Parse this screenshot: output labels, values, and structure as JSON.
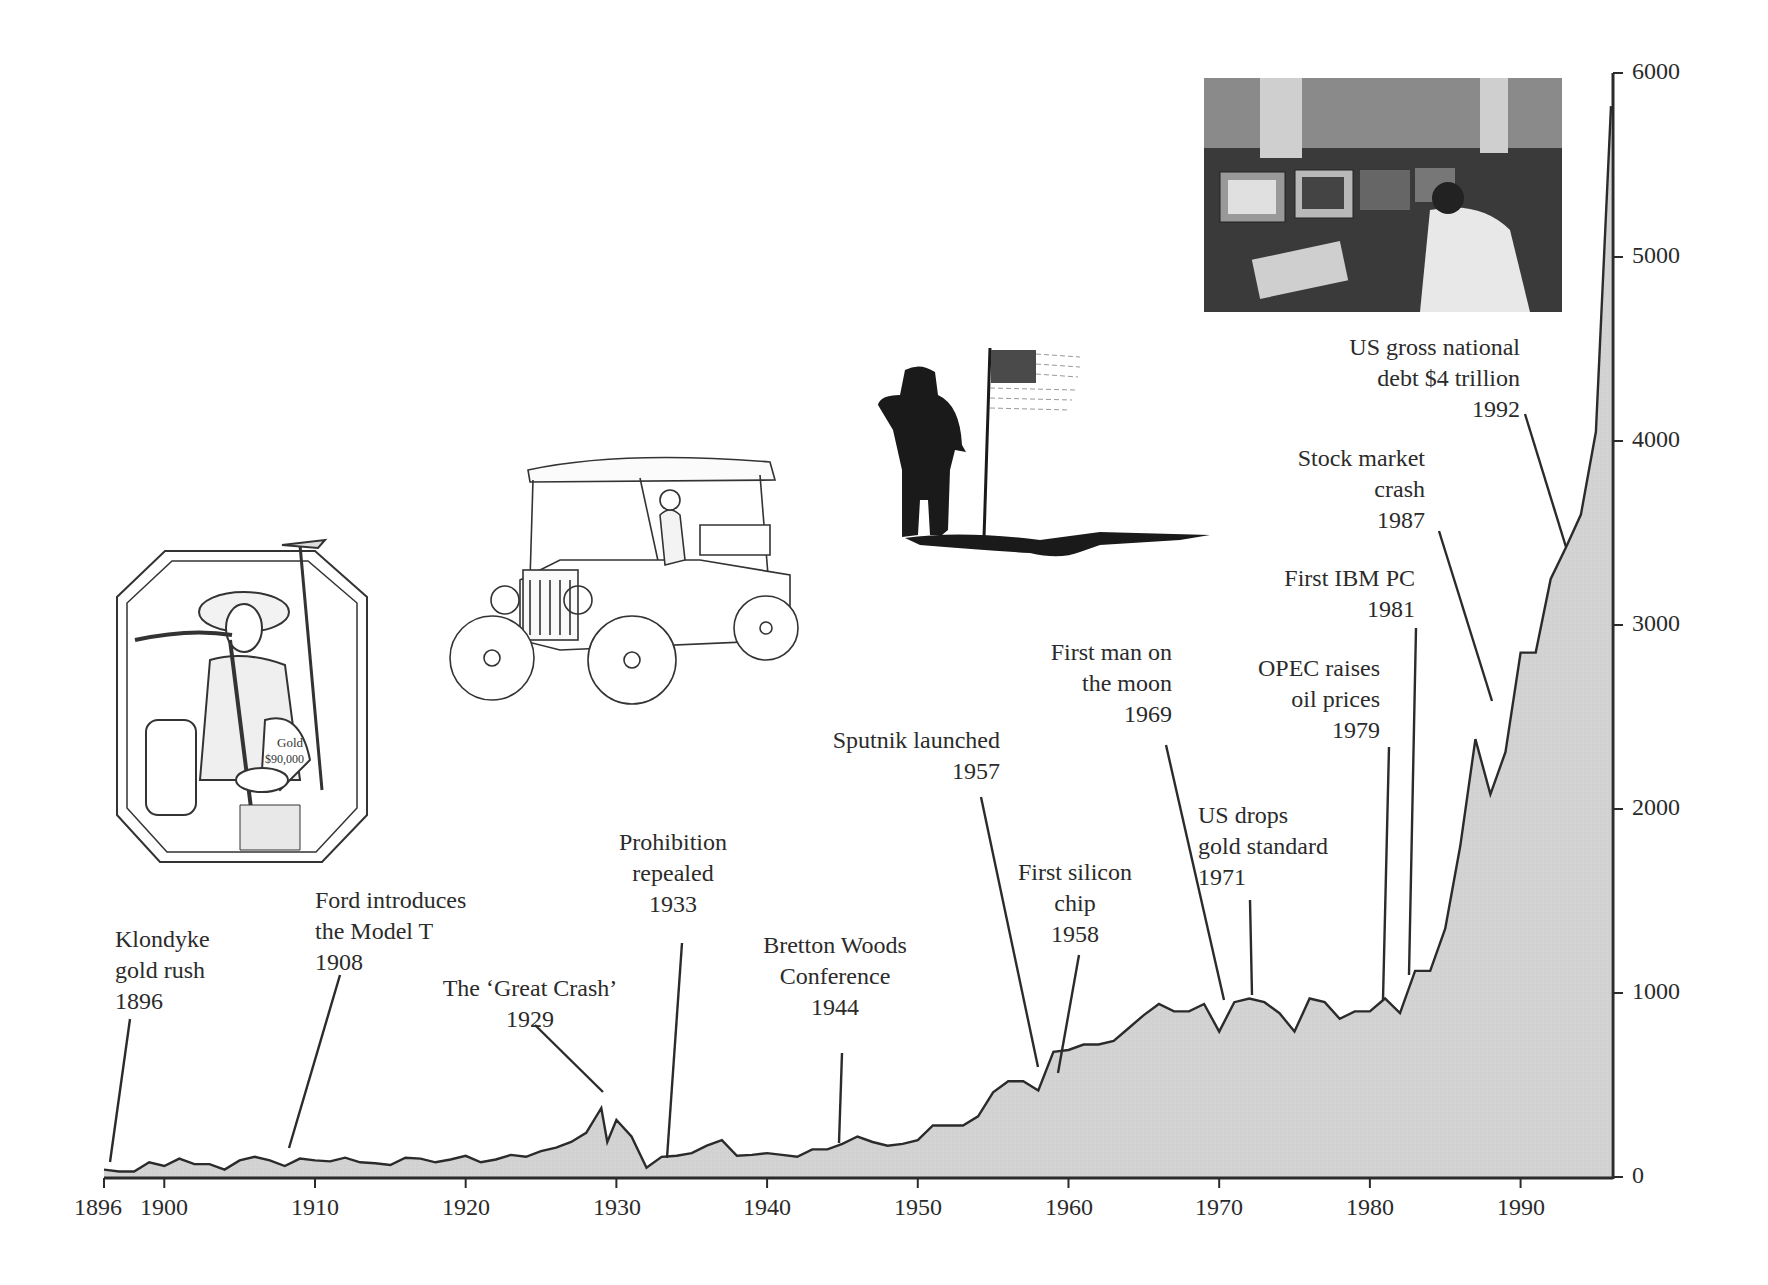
{
  "chart_data": {
    "type": "area",
    "title": "",
    "xlabel": "",
    "ylabel": "",
    "xlim": [
      1896,
      1996
    ],
    "ylim": [
      0,
      6000
    ],
    "grid": false,
    "legend": null,
    "x_ticks": [
      "1896",
      "1900",
      "1910",
      "1920",
      "1930",
      "1940",
      "1950",
      "1960",
      "1970",
      "1980",
      "1990"
    ],
    "y_ticks": [
      "0",
      "1000",
      "2000",
      "3000",
      "4000",
      "5000",
      "6000"
    ],
    "y_axis_position": "right",
    "x": [
      1896,
      1897,
      1898,
      1899,
      1900,
      1901,
      1902,
      1903,
      1904,
      1905,
      1906,
      1907,
      1908,
      1909,
      1910,
      1911,
      1912,
      1913,
      1914,
      1915,
      1916,
      1917,
      1918,
      1919,
      1920,
      1921,
      1922,
      1923,
      1924,
      1925,
      1926,
      1927,
      1928,
      1929,
      1929.4,
      1930,
      1931,
      1932,
      1933,
      1934,
      1935,
      1936,
      1937,
      1938,
      1939,
      1940,
      1941,
      1942,
      1943,
      1944,
      1945,
      1946,
      1947,
      1948,
      1949,
      1950,
      1951,
      1952,
      1953,
      1954,
      1955,
      1956,
      1957,
      1958,
      1959,
      1960,
      1961,
      1962,
      1963,
      1964,
      1965,
      1966,
      1967,
      1968,
      1969,
      1970,
      1971,
      1972,
      1973,
      1974,
      1975,
      1976,
      1977,
      1978,
      1979,
      1980,
      1981,
      1982,
      1983,
      1984,
      1985,
      1986,
      1987,
      1988,
      1989,
      1990,
      1991,
      1992,
      1993,
      1994,
      1995,
      1996
    ],
    "values": [
      40,
      30,
      30,
      80,
      60,
      100,
      70,
      70,
      40,
      90,
      110,
      90,
      60,
      100,
      90,
      85,
      105,
      80,
      75,
      65,
      105,
      100,
      80,
      95,
      115,
      80,
      95,
      120,
      110,
      140,
      160,
      190,
      240,
      375,
      190,
      310,
      220,
      50,
      110,
      115,
      130,
      170,
      200,
      115,
      120,
      130,
      120,
      110,
      150,
      150,
      180,
      220,
      190,
      170,
      180,
      200,
      280,
      280,
      280,
      330,
      460,
      520,
      520,
      470,
      680,
      690,
      720,
      720,
      740,
      810,
      880,
      940,
      900,
      900,
      940,
      790,
      950,
      970,
      950,
      890,
      790,
      970,
      950,
      860,
      900,
      900,
      970,
      890,
      1120,
      1120,
      1350,
      1800,
      2380,
      2080,
      2310,
      2850,
      2850,
      3250,
      3420,
      3600,
      4050,
      5820
    ],
    "annotations": [
      {
        "text": [
          "Klondyke",
          "gold rush",
          "1896"
        ],
        "year": 1896
      },
      {
        "text": [
          "Ford introduces",
          "the Model T",
          "1908"
        ],
        "year": 1908
      },
      {
        "text": [
          "The ‘Great Crash’",
          "1929"
        ],
        "year": 1929
      },
      {
        "text": [
          "Prohibition",
          "repealed",
          "1933"
        ],
        "year": 1933
      },
      {
        "text": [
          "Bretton Woods",
          "Conference",
          "1944"
        ],
        "year": 1944
      },
      {
        "text": [
          "Sputnik launched",
          "1957"
        ],
        "year": 1957
      },
      {
        "text": [
          "First silicon",
          "chip",
          "1958"
        ],
        "year": 1958
      },
      {
        "text": [
          "First man on",
          "the moon",
          "1969"
        ],
        "year": 1969
      },
      {
        "text": [
          "US drops",
          "gold standard",
          "1971"
        ],
        "year": 1971
      },
      {
        "text": [
          "OPEC raises",
          "oil prices",
          "1979"
        ],
        "year": 1979
      },
      {
        "text": [
          "First IBM PC",
          "1981"
        ],
        "year": 1981
      },
      {
        "text": [
          "Stock market",
          "crash",
          "1987"
        ],
        "year": 1987
      },
      {
        "text": [
          "US gross national",
          "debt $4 trillion",
          "1992"
        ],
        "year": 1992
      }
    ],
    "fill_color": "#d2d2d2",
    "line_color": "#2b2b2b"
  },
  "axis": {
    "x_labels": {
      "1896": "1896",
      "1900": "1900",
      "1910": "1910",
      "1920": "1920",
      "1930": "1930",
      "1940": "1940",
      "1950": "1950",
      "1960": "1960",
      "1970": "1970",
      "1980": "1980",
      "1990": "1990"
    },
    "y_labels": {
      "0": "0",
      "1000": "1000",
      "2000": "2000",
      "3000": "3000",
      "4000": "4000",
      "5000": "5000",
      "6000": "6000"
    }
  },
  "labels": {
    "klondyke": [
      "Klondyke",
      "gold rush",
      "1896"
    ],
    "ford": [
      "Ford introduces",
      "the Model T",
      "1908"
    ],
    "crash29": [
      "The ‘Great Crash’",
      "1929"
    ],
    "prohibition": [
      "Prohibition",
      "repealed",
      "1933"
    ],
    "bretton": [
      "Bretton Woods",
      "Conference",
      "1944"
    ],
    "sputnik": [
      "Sputnik launched",
      "1957"
    ],
    "silicon": [
      "First silicon",
      "chip",
      "1958"
    ],
    "moon": [
      "First man on",
      "the moon",
      "1969"
    ],
    "gold": [
      "US drops",
      "gold standard",
      "1971"
    ],
    "opec": [
      "OPEC raises",
      "oil prices",
      "1979"
    ],
    "ibm": [
      "First IBM PC",
      "1981"
    ],
    "crash87": [
      "Stock market",
      "crash",
      "1987"
    ],
    "debt": [
      "US gross national",
      "debt $4 trillion",
      "1992"
    ]
  },
  "illustrations": {
    "gold_bag_text": [
      "Gold",
      "$90,000"
    ]
  }
}
